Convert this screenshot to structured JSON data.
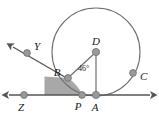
{
  "figure": {
    "type": "geometry-diagram",
    "width": 159,
    "height": 120
  },
  "style": {
    "background": "#ffffff",
    "stroke": "#6e6e6e",
    "stroke_dark": "#555555",
    "point_fill": "#9a9a9a",
    "point_stroke": "#6e6e6e",
    "shade_fill": "#a8a8a8",
    "label_color": "#1a1a1a"
  },
  "circle": {
    "center_label": "D",
    "cx": 96,
    "cy": 52,
    "r": 44
  },
  "points": [
    {
      "id": "Y",
      "label": "Y",
      "x": 27,
      "y": 53,
      "label_x": 34,
      "label_y": 50
    },
    {
      "id": "Z",
      "label": "Z",
      "x": 24,
      "y": 95,
      "label_x": 21,
      "label_y": 111
    },
    {
      "id": "B",
      "label": "B",
      "x": 68,
      "y": 78,
      "label_x": 57,
      "label_y": 76
    },
    {
      "id": "P",
      "label": "P",
      "x": 82,
      "y": 95,
      "label_x": 76,
      "label_y": 110
    },
    {
      "id": "A",
      "label": "A",
      "x": 96,
      "y": 95,
      "label_x": 93,
      "label_y": 111
    },
    {
      "id": "D",
      "label": "D",
      "x": 96,
      "y": 52,
      "label_x": 93,
      "label_y": 45
    },
    {
      "id": "C",
      "label": "C",
      "x": 133,
      "y": 73,
      "label_x": 141,
      "label_y": 80
    }
  ],
  "angles": [
    {
      "id": "BDA",
      "label": "46°",
      "value": 46,
      "unit": "degrees",
      "vertex": "D",
      "label_x": 79,
      "label_y": 71
    }
  ],
  "lines": [
    {
      "id": "horizontal-axis",
      "from": "Z-arrow-left",
      "to": "right-arrow",
      "x1": 7,
      "y1": 95,
      "x2": 152,
      "y2": 95,
      "arrows": "both"
    },
    {
      "id": "ray-YZ",
      "from": "Y",
      "to": "B",
      "x1": 11,
      "y1": 45,
      "x2": 70,
      "y2": 80,
      "arrows": "start"
    },
    {
      "id": "segment-DB",
      "from": "D",
      "to": "B",
      "x1": 96,
      "y1": 52,
      "x2": 68,
      "y2": 78,
      "arrows": "none"
    },
    {
      "id": "segment-DA",
      "from": "D",
      "to": "A",
      "x1": 96,
      "y1": 52,
      "x2": 96,
      "y2": 95,
      "arrows": "none"
    }
  ],
  "shaded_region": {
    "id": "region-YZPB",
    "description": "shaded region bounded by line YZ, the horizontal axis, and arc BP",
    "fill": "#a8a8a8"
  },
  "labels_visible": [
    "Y",
    "Z",
    "B",
    "P",
    "A",
    "D",
    "C",
    "46°"
  ]
}
